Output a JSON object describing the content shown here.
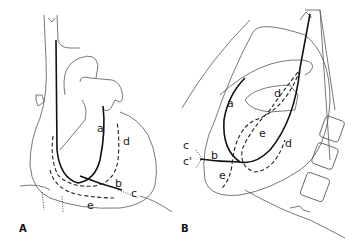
{
  "figure": {
    "panels": [
      {
        "id": "A",
        "label": "A",
        "view": "frontal",
        "curve_labels": [
          "a",
          "b",
          "c",
          "d",
          "e"
        ]
      },
      {
        "id": "B",
        "label": "B",
        "view": "lateral",
        "curve_labels": [
          "a",
          "b",
          "c",
          "c'",
          "d",
          "d",
          "e",
          "e"
        ]
      }
    ],
    "line_styles": {
      "a": "solid-thick",
      "b": "solid-thick",
      "c": "dotted",
      "d": "dashed",
      "e": "dashed"
    },
    "colors": {
      "outline": "#555555",
      "catheter": "#111111",
      "background": "#ffffff"
    }
  }
}
